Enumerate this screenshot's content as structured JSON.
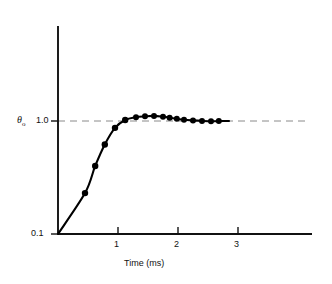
{
  "chart_data": {
    "type": "line",
    "title": "",
    "subtitle": "",
    "xlabel": "Time (ms)",
    "ylabel": "θo",
    "ylabel_plain": "theta-o",
    "xlim": [
      0,
      3.5
    ],
    "ylim": [
      0.1,
      1.3
    ],
    "yscale": "log",
    "grid": false,
    "legend": null,
    "x_ticks": [
      "1",
      "2",
      "3"
    ],
    "x_tick_values": [
      1,
      2,
      3
    ],
    "y_ticks": [
      "0.1",
      "1.0"
    ],
    "y_tick_values": [
      0.1,
      1.0
    ],
    "reference_line": {
      "name": "steady-state-line",
      "y": 1.0,
      "style": "dashed",
      "color": "#888888"
    },
    "series": [
      {
        "name": "step-response",
        "marker": "filled-circle",
        "color": "#000000",
        "x": [
          0.45,
          0.62,
          0.78,
          0.95,
          1.12,
          1.3,
          1.45,
          1.6,
          1.75,
          1.86,
          1.98,
          2.1,
          2.25,
          2.4,
          2.55,
          2.68
        ],
        "y": [
          0.23,
          0.4,
          0.62,
          0.87,
          1.02,
          1.08,
          1.1,
          1.11,
          1.09,
          1.07,
          1.045,
          1.025,
          1.012,
          1.002,
          0.995,
          0.998
        ]
      }
    ],
    "curve_start": {
      "x": 0.0,
      "y": 0.1
    },
    "annotations": []
  },
  "axes": {
    "y_label_theta": "θ",
    "y_label_subscript": "o",
    "y_tick_top": "1.0",
    "y_tick_bottom": "0.1",
    "x_tick_1": "1",
    "x_tick_2": "2",
    "x_tick_3": "3",
    "x_axis_title": "Time (ms)"
  },
  "colors": {
    "axis": "#111111",
    "curve": "#000000",
    "marker": "#000000",
    "reference": "#8a8a8a",
    "background": "#ffffff"
  }
}
